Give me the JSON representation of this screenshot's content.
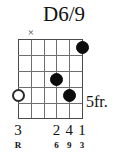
{
  "chord": {
    "name": "D6/9",
    "position_label": "5fr.",
    "strings_count": 6,
    "frets_count": 5,
    "string_markers": [
      {
        "string": 6,
        "symbol": ""
      },
      {
        "string": 5,
        "symbol": "×"
      },
      {
        "string": 4,
        "symbol": ""
      },
      {
        "string": 3,
        "symbol": ""
      },
      {
        "string": 2,
        "symbol": ""
      },
      {
        "string": 1,
        "symbol": ""
      }
    ],
    "dots": [
      {
        "string": 1,
        "fret": 1,
        "type": "filled"
      },
      {
        "string": 3,
        "fret": 3,
        "type": "filled"
      },
      {
        "string": 2,
        "fret": 4,
        "type": "filled"
      },
      {
        "string": 6,
        "fret": 4,
        "type": "open"
      }
    ],
    "finger_numbers": [
      {
        "string": 6,
        "label": "3"
      },
      {
        "string": 3,
        "label": "2"
      },
      {
        "string": 2,
        "label": "4"
      },
      {
        "string": 1,
        "label": "1"
      }
    ],
    "interval_labels": [
      {
        "string": 6,
        "label": "R"
      },
      {
        "string": 3,
        "label": "6"
      },
      {
        "string": 2,
        "label": "9"
      },
      {
        "string": 1,
        "label": "3"
      }
    ],
    "colors": {
      "background": "#ffffff",
      "grid_line": "#6f6f6f",
      "grid_edge": "#4a4a4a",
      "dot_filled": "#0d0d0d",
      "dot_open_border": "#2a2a2a",
      "text": "#111111"
    }
  }
}
